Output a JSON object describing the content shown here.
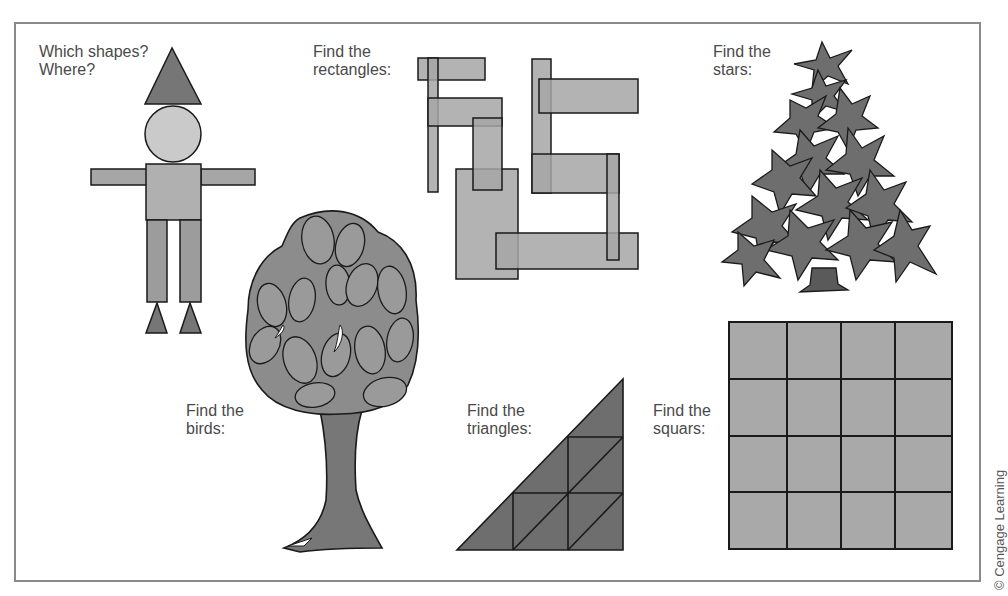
{
  "figure": {
    "prompts": {
      "shapes": {
        "line1": "Which shapes?",
        "line2": "Where?"
      },
      "rectangles": {
        "line1": "Find the",
        "line2": "rectangles:"
      },
      "stars": {
        "line1": "Find the",
        "line2": "stars:"
      },
      "birds": {
        "line1": "Find the",
        "line2": "birds:"
      },
      "triangles": {
        "line1": "Find the",
        "line2": "triangles:"
      },
      "squares": {
        "line1": "Find the",
        "line2": "squars:"
      }
    },
    "credit": "© Cengage Learning",
    "panels": [
      {
        "id": "shape-figure",
        "content": "figure built from triangle hat, circle head, rectangle body/arms/legs, triangle feet"
      },
      {
        "id": "rectangles",
        "count_drawn": 10
      },
      {
        "id": "star-tree",
        "content": "tree composed of overlapping stars"
      },
      {
        "id": "bird-tree",
        "content": "tree canopy composed of bird shapes"
      },
      {
        "id": "triangles",
        "content": "right triangle subdivided into smaller triangles"
      },
      {
        "id": "squares",
        "grid": "4x4"
      }
    ],
    "colors": {
      "frame": "#8a8a8a",
      "dark_fill": "#767676",
      "mid_fill": "#a6a6a6",
      "light_fill": "#cacaca",
      "stroke": "#1a1a1a",
      "text": "#4a4a4a"
    }
  }
}
